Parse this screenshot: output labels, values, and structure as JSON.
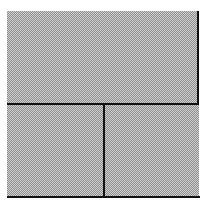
{
  "canvas": {
    "width": 207,
    "height": 205,
    "background": "#ffffff"
  },
  "pattern": {
    "light": "#d0d0d0",
    "dark": "#8e8e8e"
  },
  "line_color": "#111111",
  "panels": [
    {
      "name": "top-panel"
    },
    {
      "name": "bottom-left-panel"
    },
    {
      "name": "bottom-right-panel"
    }
  ]
}
